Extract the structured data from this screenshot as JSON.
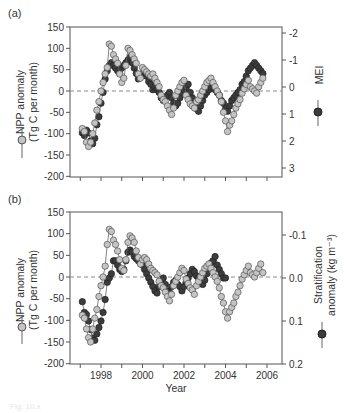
{
  "figure": {
    "caption": "Fig. 10.x"
  },
  "colors": {
    "npp_fill": "#c4c4c4",
    "npp_stroke": "#555555",
    "other_fill": "#3c3c3c",
    "other_stroke": "#222222",
    "axis": "#555555",
    "zero_line": "#888888"
  },
  "chart_data": [
    {
      "type": "line",
      "panel": "(a)",
      "title": "",
      "xlabel": "",
      "ylabel": "NPP anomaly (Tg C per month)",
      "y2label": "MEI",
      "xlim": [
        1996.8,
        2006.9
      ],
      "ylim": [
        -200,
        150
      ],
      "y2lim_inverted": [
        3.4,
        -2.2
      ],
      "yticks": [
        150,
        100,
        50,
        0,
        -50,
        -100,
        -150,
        -200
      ],
      "y2ticks": [
        -2,
        -1,
        0,
        1,
        2,
        3
      ],
      "zero_line": "dashed",
      "legend": [
        {
          "name": "NPP anomaly",
          "marker": "light-gray circle",
          "axis": "left"
        },
        {
          "name": "MEI",
          "marker": "dark-gray circle",
          "axis": "right"
        }
      ],
      "series": [
        {
          "name": "NPP anomaly",
          "axis": "left",
          "x": [
            1997.1,
            1997.2,
            1997.3,
            1997.4,
            1997.5,
            1997.6,
            1997.7,
            1997.8,
            1997.9,
            1998.0,
            1998.1,
            1998.2,
            1998.3,
            1998.4,
            1998.5,
            1998.6,
            1998.7,
            1998.8,
            1998.9,
            1999.0,
            1999.1,
            1999.2,
            1999.3,
            1999.4,
            1999.5,
            1999.6,
            1999.7,
            1999.8,
            1999.9,
            2000.0,
            2000.1,
            2000.2,
            2000.3,
            2000.4,
            2000.5,
            2000.6,
            2000.7,
            2000.8,
            2000.9,
            2001.0,
            2001.1,
            2001.2,
            2001.3,
            2001.4,
            2001.5,
            2001.6,
            2001.7,
            2001.8,
            2001.9,
            2002.0,
            2002.1,
            2002.2,
            2002.3,
            2002.4,
            2002.5,
            2002.6,
            2002.7,
            2002.8,
            2002.9,
            2003.0,
            2003.1,
            2003.2,
            2003.3,
            2003.4,
            2003.5,
            2003.6,
            2003.7,
            2003.8,
            2003.9,
            2004.0,
            2004.1,
            2004.2,
            2004.3,
            2004.4,
            2004.5,
            2004.6,
            2004.7,
            2004.8,
            2004.9,
            2005.0,
            2005.1,
            2005.2,
            2005.3,
            2005.4,
            2005.5,
            2005.6,
            2005.7,
            2005.8
          ],
          "values": [
            -88,
            -95,
            -120,
            -130,
            -120,
            -100,
            -75,
            -45,
            -25,
            0,
            20,
            40,
            55,
            110,
            105,
            85,
            75,
            65,
            40,
            20,
            30,
            60,
            100,
            95,
            85,
            75,
            65,
            40,
            30,
            55,
            50,
            45,
            40,
            35,
            40,
            30,
            20,
            10,
            -10,
            -20,
            -25,
            -35,
            -45,
            -55,
            -40,
            -10,
            0,
            10,
            20,
            25,
            -10,
            -20,
            -30,
            -35,
            -40,
            -25,
            -20,
            -10,
            0,
            10,
            20,
            25,
            30,
            20,
            10,
            0,
            -10,
            -25,
            -50,
            -70,
            -95,
            -80,
            -70,
            -55,
            -40,
            -30,
            -20,
            -5,
            5,
            15,
            25,
            10,
            5,
            0,
            -5,
            10,
            20,
            30
          ],
          "marker": "light-gray circle"
        },
        {
          "name": "MEI",
          "axis": "right",
          "x": [
            1997.1,
            1997.2,
            1997.3,
            1997.4,
            1997.5,
            1997.6,
            1997.7,
            1997.8,
            1997.9,
            1998.0,
            1998.1,
            1998.2,
            1998.3,
            1998.4,
            1998.5,
            1998.6,
            1998.7,
            1998.8,
            1998.9,
            1999.0,
            1999.1,
            1999.2,
            1999.3,
            1999.4,
            1999.5,
            1999.6,
            1999.7,
            1999.8,
            1999.9,
            2000.0,
            2000.1,
            2000.2,
            2000.3,
            2000.4,
            2000.5,
            2000.6,
            2000.7,
            2000.8,
            2000.9,
            2001.0,
            2001.1,
            2001.2,
            2001.3,
            2001.4,
            2001.5,
            2001.6,
            2001.7,
            2001.8,
            2001.9,
            2002.0,
            2002.1,
            2002.2,
            2002.3,
            2002.4,
            2002.5,
            2002.6,
            2002.7,
            2002.8,
            2002.9,
            2003.0,
            2003.1,
            2003.2,
            2003.3,
            2003.4,
            2003.5,
            2003.6,
            2003.7,
            2003.8,
            2003.9,
            2004.0,
            2004.1,
            2004.2,
            2004.3,
            2004.4,
            2004.5,
            2004.6,
            2004.7,
            2004.8,
            2004.9,
            2005.0,
            2005.1,
            2005.2,
            2005.3,
            2005.4,
            2005.5,
            2005.6,
            2005.7,
            2005.8
          ],
          "values": [
            1.7,
            1.8,
            1.6,
            1.7,
            2.0,
            2.1,
            1.9,
            1.4,
            1.1,
            0.6,
            0.2,
            -0.3,
            -0.6,
            -0.8,
            -0.9,
            -0.8,
            -0.7,
            -0.6,
            -0.5,
            -0.7,
            -0.8,
            -0.9,
            -1.0,
            -1.1,
            -0.9,
            -0.7,
            -0.5,
            -0.3,
            -0.4,
            -0.5,
            -0.6,
            -0.4,
            -0.2,
            -0.1,
            0.1,
            0.0,
            0.1,
            0.2,
            0.4,
            0.5,
            0.4,
            0.3,
            0.2,
            0.4,
            0.6,
            0.7,
            0.6,
            0.4,
            0.2,
            0.1,
            0.0,
            -0.1,
            0.2,
            0.4,
            0.6,
            0.8,
            0.9,
            0.7,
            0.5,
            0.3,
            0.2,
            0.1,
            0.0,
            -0.1,
            0.1,
            0.2,
            0.3,
            0.5,
            0.6,
            0.8,
            0.9,
            0.7,
            0.5,
            0.4,
            0.3,
            0.2,
            0.1,
            -0.1,
            -0.2,
            -0.4,
            -0.6,
            -0.7,
            -0.8,
            -0.9,
            -0.8,
            -0.7,
            -0.6,
            -0.5
          ],
          "marker": "dark-gray circle"
        }
      ]
    },
    {
      "type": "line",
      "panel": "(b)",
      "title": "",
      "xlabel": "Year",
      "ylabel": "NPP anomaly (Tg C per month)",
      "y2label": "Stratification anomaly (kg m^-3)",
      "xlim": [
        1996.8,
        2006.9
      ],
      "ylim": [
        -200,
        150
      ],
      "y2lim_inverted": [
        0.2,
        -0.15
      ],
      "xticks": [
        1998,
        2000,
        2002,
        2004,
        2006
      ],
      "yticks": [
        150,
        100,
        50,
        0,
        -50,
        -100,
        -150,
        -200
      ],
      "y2ticks": [
        -0.1,
        0.0,
        0.1,
        0.2
      ],
      "zero_line": "dashed",
      "legend": [
        {
          "name": "NPP anomaly",
          "marker": "light-gray circle",
          "axis": "left"
        },
        {
          "name": "Stratification anomaly",
          "marker": "dark-gray circle",
          "axis": "right"
        }
      ],
      "series": [
        {
          "name": "NPP anomaly",
          "axis": "left",
          "x": [
            1997.1,
            1997.2,
            1997.3,
            1997.4,
            1997.5,
            1997.6,
            1997.7,
            1997.8,
            1997.9,
            1998.0,
            1998.1,
            1998.2,
            1998.3,
            1998.4,
            1998.5,
            1998.6,
            1998.7,
            1998.8,
            1998.9,
            1999.0,
            1999.1,
            1999.2,
            1999.3,
            1999.4,
            1999.5,
            1999.6,
            1999.7,
            1999.8,
            1999.9,
            2000.0,
            2000.1,
            2000.2,
            2000.3,
            2000.4,
            2000.5,
            2000.6,
            2000.7,
            2000.8,
            2000.9,
            2001.0,
            2001.1,
            2001.2,
            2001.3,
            2001.4,
            2001.5,
            2001.6,
            2001.7,
            2001.8,
            2001.9,
            2002.0,
            2002.1,
            2002.2,
            2002.3,
            2002.4,
            2002.5,
            2002.6,
            2002.7,
            2002.8,
            2002.9,
            2003.0,
            2003.1,
            2003.2,
            2003.3,
            2003.4,
            2003.5,
            2003.6,
            2003.7,
            2003.8,
            2003.9,
            2004.0,
            2004.1,
            2004.2,
            2004.3,
            2004.4,
            2004.5,
            2004.6,
            2004.7,
            2004.8,
            2004.9,
            2005.0,
            2005.1,
            2005.2,
            2005.3,
            2005.4,
            2005.5,
            2005.6,
            2005.7,
            2005.8
          ],
          "values": [
            -88,
            -95,
            -120,
            -140,
            -150,
            -120,
            -95,
            -75,
            -45,
            -20,
            0,
            25,
            75,
            110,
            105,
            85,
            75,
            60,
            40,
            20,
            15,
            40,
            80,
            95,
            90,
            80,
            60,
            45,
            30,
            40,
            45,
            40,
            30,
            20,
            15,
            10,
            5,
            -10,
            -20,
            -25,
            -35,
            -45,
            -55,
            -40,
            -20,
            -10,
            0,
            10,
            20,
            15,
            -5,
            -15,
            -25,
            -30,
            -40,
            -20,
            -10,
            0,
            10,
            20,
            25,
            30,
            20,
            10,
            0,
            -10,
            -25,
            -45,
            -60,
            -80,
            -95,
            -80,
            -70,
            -60,
            -45,
            -35,
            -20,
            -5,
            5,
            15,
            25,
            10,
            5,
            0,
            10,
            20,
            30,
            10
          ],
          "marker": "light-gray circle"
        },
        {
          "name": "Stratification anomaly",
          "axis": "right",
          "x": [
            1997.1,
            1997.2,
            1997.3,
            1997.4,
            1997.5,
            1997.6,
            1997.7,
            1997.8,
            1997.9,
            1998.0,
            1998.1,
            1998.2,
            1998.3,
            1998.4,
            1998.5,
            1998.6,
            1998.7,
            1998.8,
            1998.9,
            1999.0,
            1999.1,
            1999.2,
            1999.3,
            1999.4,
            1999.5,
            1999.6,
            1999.7,
            1999.8,
            1999.9,
            2000.0,
            2000.1,
            2000.2,
            2000.3,
            2000.4,
            2000.5,
            2000.6,
            2000.7,
            2000.8,
            2000.9,
            2001.0,
            2001.1,
            2001.2,
            2001.3,
            2001.4,
            2001.5,
            2001.6,
            2001.7,
            2001.8,
            2001.9,
            2002.0,
            2002.1,
            2002.2,
            2002.3,
            2002.4,
            2002.5,
            2002.6,
            2002.7,
            2002.8,
            2002.9,
            2003.0,
            2003.1,
            2003.2,
            2003.3,
            2003.4,
            2003.5,
            2003.6,
            2003.7,
            2003.8,
            2003.9,
            2004.0
          ],
          "values": [
            0.055,
            0.08,
            0.085,
            0.1,
            0.12,
            0.14,
            0.145,
            0.13,
            0.115,
            0.1,
            0.08,
            0.05,
            0.01,
            0.0,
            -0.01,
            -0.04,
            -0.04,
            -0.03,
            -0.02,
            -0.015,
            -0.02,
            -0.04,
            -0.06,
            -0.065,
            -0.06,
            -0.05,
            -0.045,
            -0.04,
            -0.035,
            -0.03,
            -0.02,
            -0.01,
            0.0,
            0.01,
            0.02,
            0.03,
            0.035,
            0.02,
            0.01,
            0.0,
            0.015,
            0.03,
            0.035,
            0.02,
            0.01,
            0.005,
            0.015,
            0.02,
            0.03,
            0.02,
            0.01,
            0.0,
            -0.01,
            -0.02,
            -0.015,
            -0.005,
            0.0,
            0.01,
            0.015,
            0.005,
            -0.01,
            -0.025,
            -0.035,
            -0.04,
            -0.05,
            -0.03,
            -0.02,
            -0.01,
            0.0,
            0.0
          ],
          "marker": "dark-gray circle"
        }
      ]
    }
  ],
  "panels": {
    "a": {
      "label": "(a)",
      "ylabel_line1": "NPP anomaly",
      "ylabel_line2": "(Tg C per month)",
      "y2label": "MEI",
      "yticks": [
        "150",
        "100",
        "50",
        "0",
        "-50",
        "-100",
        "-150",
        "-200"
      ],
      "y2ticks": [
        "-2",
        "-1",
        "0",
        "1",
        "2",
        "3"
      ]
    },
    "b": {
      "label": "(b)",
      "ylabel_line1": "NPP anomaly",
      "ylabel_line2": "(Tg C per month)",
      "y2label_line1": "Stratification",
      "y2label_line2": "anomaly (kg m⁻³)",
      "yticks": [
        "150",
        "100",
        "50",
        "0",
        "-50",
        "-100",
        "-150",
        "-200"
      ],
      "y2ticks": [
        "-0.1",
        "0.0",
        "0.1",
        "0.2"
      ],
      "xticks": [
        "1998",
        "2000",
        "2002",
        "2004",
        "2006"
      ],
      "xlabel": "Year"
    }
  }
}
